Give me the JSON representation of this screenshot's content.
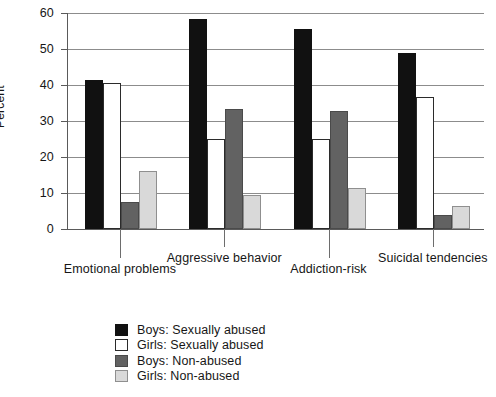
{
  "chart_data": {
    "type": "bar",
    "title": "",
    "xlabel": "",
    "ylabel": "Percent",
    "ylim": [
      0,
      60
    ],
    "yticks": [
      0,
      10,
      20,
      30,
      40,
      50,
      60
    ],
    "ytick_labels": [
      "0",
      "10",
      "20",
      "30",
      "40",
      "50",
      "60"
    ],
    "grid": true,
    "legend_position": "bottom-center",
    "categories": [
      "Emotional problems",
      "Aggressive behavior",
      "Addiction-risk",
      "Suicidal tendencies"
    ],
    "series": [
      {
        "name": "Boys: Sexually abused",
        "color": "#111111",
        "values": [
          41.4,
          58.2,
          55.5,
          48.9
        ]
      },
      {
        "name": "Girls: Sexually abused",
        "color": "#ffffff",
        "values": [
          40.5,
          25.0,
          25.0,
          36.7
        ]
      },
      {
        "name": "Boys: Non-abused",
        "color": "#626262",
        "values": [
          7.5,
          33.3,
          32.8,
          4.0
        ]
      },
      {
        "name": "Girls: Non-abused",
        "color": "#d9d9d9",
        "values": [
          16.2,
          9.5,
          11.4,
          6.4
        ]
      }
    ]
  },
  "legend": {
    "items": [
      {
        "label": "Boys: Sexually abused"
      },
      {
        "label": "Girls: Sexually abused"
      },
      {
        "label": "Boys: Non-abused"
      },
      {
        "label": "Girls: Non-abused"
      }
    ]
  }
}
